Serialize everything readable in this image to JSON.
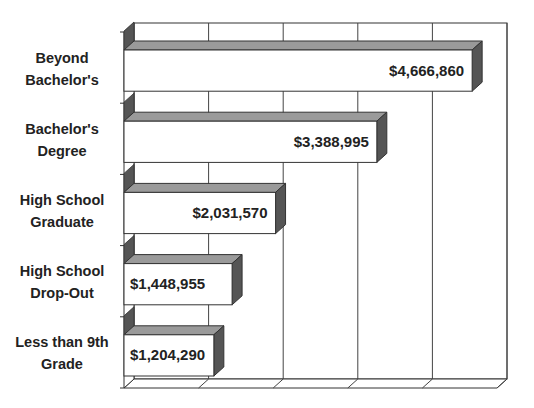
{
  "chart_data": {
    "type": "bar",
    "orientation": "horizontal",
    "style": "3d",
    "title": "",
    "xlabel": "",
    "ylabel": "",
    "categories": [
      "Beyond Bachelor's",
      "Bachelor's Degree",
      "High School Graduate",
      "High School Drop-Out",
      "Less than 9th Grade"
    ],
    "category_lines": [
      [
        "Beyond",
        "Bachelor's"
      ],
      [
        "Bachelor's",
        "Degree"
      ],
      [
        "High School",
        "Graduate"
      ],
      [
        "High School",
        "Drop-Out"
      ],
      [
        "Less than 9th",
        "Grade"
      ]
    ],
    "values": [
      4666860,
      3388995,
      2031570,
      1448955,
      1204290
    ],
    "value_labels": [
      "$4,666,860",
      "$3,388,995",
      "$2,031,570",
      "$1,448,955",
      "$1,204,290"
    ],
    "xlim": [
      0,
      5000000
    ],
    "grid": true,
    "gridlines": 5,
    "legend": null,
    "colors": {
      "bar_face": "#ffffff",
      "bar_top": "#9a9a9a",
      "bar_side": "#555555",
      "axis": "#333333",
      "grid": "#444444"
    }
  }
}
